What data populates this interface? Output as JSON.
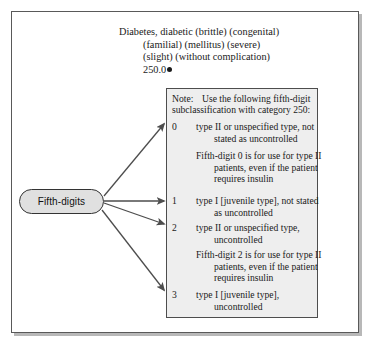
{
  "diagram": {
    "heading": {
      "line_1": "Diabetes, diabetic (brittle) (congenital)",
      "line_2": "(familial) (mellitus) (severe)",
      "line_3": "(slight) (without complication)",
      "line_4": "250.0"
    },
    "note": {
      "label": "Note:",
      "line_1": "Use the following fifth-digit",
      "line_2": "subclassification with category 250:"
    },
    "source_node": {
      "label": "Fifth-digits"
    },
    "entries": [
      {
        "digit": "0",
        "text_1": "type II or unspecified type, not",
        "text_2": "stated as uncontrolled"
      },
      {
        "digit": "1",
        "text_1": "type I [juvenile type], not stated",
        "text_2": "as uncontrolled"
      },
      {
        "digit": "2",
        "text_1": "type II or unspecified type,",
        "text_2": "uncontrolled"
      },
      {
        "digit": "3",
        "text_1": "type I [juvenile type],",
        "text_2": "uncontrolled"
      }
    ],
    "paragraphs": [
      {
        "text_1": "Fifth-digit 0 is for use for type II",
        "text_2": "patients, even if the patient",
        "text_3": "requires insulin"
      },
      {
        "text_1": "Fifth-digit 2 is for use for type II",
        "text_2": "patients, even if the patient",
        "text_3": "requires insulin"
      }
    ],
    "colors": {
      "frame_border": "#595959",
      "note_fill": "#eeeeee",
      "note_border": "#4d4d4d",
      "oval_fill": "#e0e0e0",
      "arrow": "#4d4d4d"
    }
  }
}
